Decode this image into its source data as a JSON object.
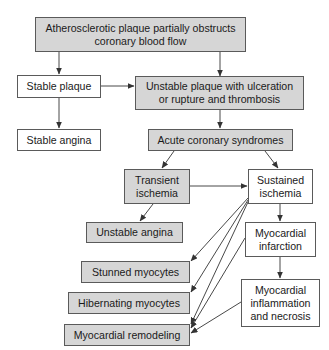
{
  "diagram": {
    "type": "flowchart",
    "colors": {
      "shaded_fill": "#d6d6d6",
      "plain_fill": "#ffffff",
      "border": "#5a5a5a",
      "arrow": "#333333"
    },
    "nodes": {
      "atherosclerotic": {
        "label": "Atherosclerotic plaque partially obstructs\ncoronary blood flow",
        "shaded": true
      },
      "stable_plaque": {
        "label": "Stable plaque",
        "shaded": false
      },
      "unstable_plaque": {
        "label": "Unstable plaque with ulceration\nor rupture and thrombosis",
        "shaded": true
      },
      "stable_angina": {
        "label": "Stable angina",
        "shaded": false
      },
      "acs": {
        "label": "Acute coronary syndromes",
        "shaded": true
      },
      "transient_ischemia": {
        "label": "Transient\nischemia",
        "shaded": true
      },
      "sustained_ischemia": {
        "label": "Sustained\nischemia",
        "shaded": false
      },
      "unstable_angina": {
        "label": "Unstable angina",
        "shaded": true
      },
      "myocardial_infarction": {
        "label": "Myocardial\ninfarction",
        "shaded": false
      },
      "stunned": {
        "label": "Stunned myocytes",
        "shaded": true
      },
      "hibernating": {
        "label": "Hibernating myocytes",
        "shaded": true
      },
      "inflammation": {
        "label": "Myocardial\ninflammation\nand necrosis",
        "shaded": false
      },
      "remodeling": {
        "label": "Myocardial remodeling",
        "shaded": true
      }
    },
    "edges": [
      [
        "atherosclerotic",
        "stable_plaque"
      ],
      [
        "atherosclerotic",
        "unstable_plaque"
      ],
      [
        "stable_plaque",
        "unstable_plaque"
      ],
      [
        "stable_plaque",
        "stable_angina"
      ],
      [
        "unstable_plaque",
        "acs"
      ],
      [
        "acs",
        "transient_ischemia"
      ],
      [
        "acs",
        "sustained_ischemia"
      ],
      [
        "transient_ischemia",
        "sustained_ischemia"
      ],
      [
        "transient_ischemia",
        "unstable_angina"
      ],
      [
        "sustained_ischemia",
        "myocardial_infarction"
      ],
      [
        "sustained_ischemia",
        "stunned"
      ],
      [
        "sustained_ischemia",
        "hibernating"
      ],
      [
        "sustained_ischemia",
        "remodeling"
      ],
      [
        "myocardial_infarction",
        "inflammation"
      ],
      [
        "myocardial_infarction",
        "remodeling"
      ],
      [
        "inflammation",
        "remodeling"
      ]
    ]
  }
}
